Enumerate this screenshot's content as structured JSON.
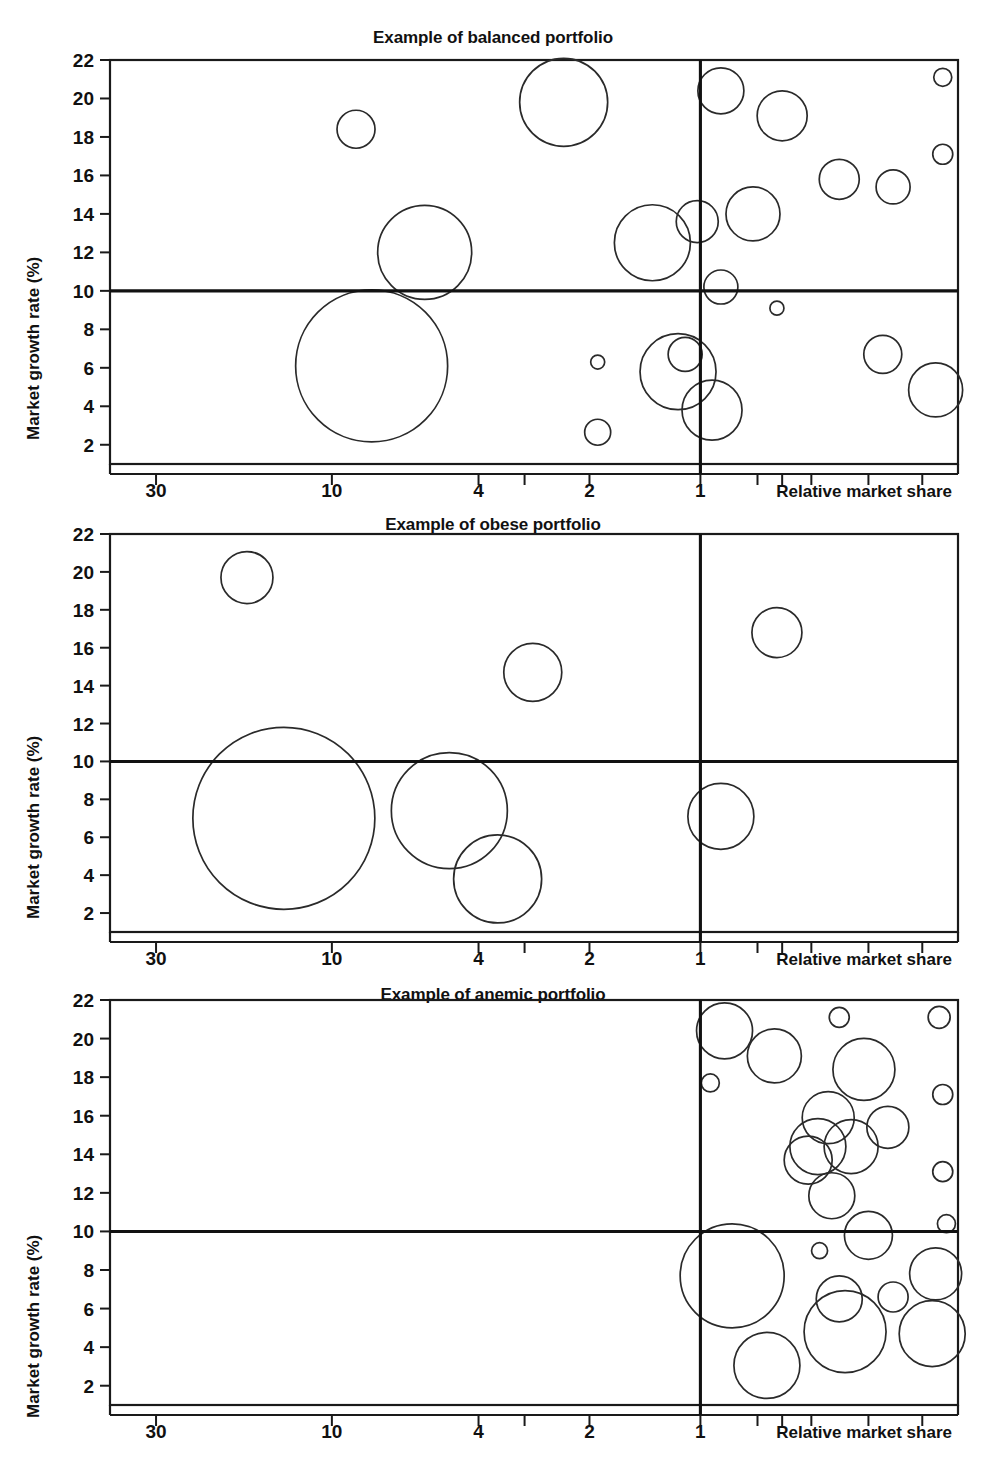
{
  "figure": {
    "background": "#ffffff",
    "line_color": "#1a1a1a",
    "bubble_stroke": "#2a2a2a"
  },
  "panels": [
    {
      "id": "balanced",
      "title": "Example of balanced portfolio"
    },
    {
      "id": "obese",
      "title": "Example of obese portfolio"
    },
    {
      "id": "anemic",
      "title": "Example of anemic portfolio"
    }
  ],
  "axes": {
    "y_axis_label": "Market growth rate (%)",
    "x_axis_label": "Relative market share",
    "y_ticks": [
      2,
      4,
      6,
      8,
      10,
      12,
      14,
      16,
      18,
      20,
      22
    ],
    "y_tick_labels": [
      "2",
      "4",
      "6",
      "8",
      "10",
      "12",
      "14",
      "16",
      "18",
      "20",
      "22"
    ],
    "x_tick_labels": [
      "30",
      "10",
      "4",
      "2",
      "1"
    ],
    "x_labeled_values": [
      30,
      10,
      4,
      2,
      1
    ],
    "x_minor_values": [
      3,
      0.7,
      0.6,
      0.5,
      0.35,
      0.25
    ],
    "x_scale": "log-reversed",
    "xlim": [
      40,
      0.2
    ],
    "ylim": [
      1,
      22
    ],
    "quadrant_split_y": 10,
    "quadrant_split_x": 1,
    "grid": false,
    "legend": "none"
  },
  "chart_data": {
    "type": "scatter",
    "xlabel": "Relative market share",
    "ylabel": "Market growth rate (%)",
    "xlim": [
      40,
      0.2
    ],
    "ylim": [
      1,
      22
    ],
    "x_scale": "log (descending)",
    "grid": false,
    "legend_position": "none",
    "quadrant_lines": {
      "horizontal_y": 10,
      "vertical_x": 1
    },
    "series": [
      {
        "name": "Example of balanced portfolio",
        "points": [
          {
            "x": 8.6,
            "y": 18.4,
            "size": 19
          },
          {
            "x": 2.35,
            "y": 19.8,
            "size": 44
          },
          {
            "x": 0.88,
            "y": 20.4,
            "size": 23
          },
          {
            "x": 0.6,
            "y": 19.1,
            "size": 25
          },
          {
            "x": 0.22,
            "y": 21.1,
            "size": 9
          },
          {
            "x": 0.22,
            "y": 17.1,
            "size": 10
          },
          {
            "x": 0.42,
            "y": 15.8,
            "size": 20
          },
          {
            "x": 0.3,
            "y": 15.4,
            "size": 17
          },
          {
            "x": 0.72,
            "y": 14.0,
            "size": 27
          },
          {
            "x": 1.35,
            "y": 12.5,
            "size": 38
          },
          {
            "x": 1.02,
            "y": 13.6,
            "size": 21
          },
          {
            "x": 0.88,
            "y": 10.2,
            "size": 17
          },
          {
            "x": 5.6,
            "y": 12.0,
            "size": 47
          },
          {
            "x": 7.8,
            "y": 6.1,
            "size": 76
          },
          {
            "x": 0.62,
            "y": 9.1,
            "size": 7
          },
          {
            "x": 1.9,
            "y": 6.3,
            "size": 7
          },
          {
            "x": 1.9,
            "y": 2.65,
            "size": 13
          },
          {
            "x": 1.15,
            "y": 5.8,
            "size": 38
          },
          {
            "x": 1.1,
            "y": 6.7,
            "size": 17
          },
          {
            "x": 0.93,
            "y": 3.8,
            "size": 30
          },
          {
            "x": 0.32,
            "y": 6.7,
            "size": 19
          },
          {
            "x": 0.23,
            "y": 4.85,
            "size": 27
          }
        ]
      },
      {
        "name": "Example of obese portfolio",
        "points": [
          {
            "x": 17.0,
            "y": 19.7,
            "size": 26
          },
          {
            "x": 2.85,
            "y": 14.7,
            "size": 29
          },
          {
            "x": 0.62,
            "y": 16.8,
            "size": 25
          },
          {
            "x": 13.5,
            "y": 7.0,
            "size": 91
          },
          {
            "x": 4.8,
            "y": 7.4,
            "size": 58
          },
          {
            "x": 3.55,
            "y": 3.8,
            "size": 44
          },
          {
            "x": 0.88,
            "y": 7.1,
            "size": 33
          }
        ]
      },
      {
        "name": "Example of anemic portfolio",
        "points": [
          {
            "x": 0.86,
            "y": 20.4,
            "size": 28
          },
          {
            "x": 0.94,
            "y": 17.7,
            "size": 9
          },
          {
            "x": 0.63,
            "y": 19.1,
            "size": 27
          },
          {
            "x": 0.42,
            "y": 21.1,
            "size": 10
          },
          {
            "x": 0.225,
            "y": 21.1,
            "size": 11
          },
          {
            "x": 0.36,
            "y": 18.4,
            "size": 31
          },
          {
            "x": 0.22,
            "y": 17.1,
            "size": 10
          },
          {
            "x": 0.51,
            "y": 13.7,
            "size": 24
          },
          {
            "x": 0.45,
            "y": 15.9,
            "size": 26
          },
          {
            "x": 0.48,
            "y": 14.4,
            "size": 28
          },
          {
            "x": 0.39,
            "y": 14.4,
            "size": 27
          },
          {
            "x": 0.31,
            "y": 15.4,
            "size": 21
          },
          {
            "x": 0.22,
            "y": 13.1,
            "size": 10
          },
          {
            "x": 0.44,
            "y": 11.85,
            "size": 23
          },
          {
            "x": 0.35,
            "y": 9.8,
            "size": 24
          },
          {
            "x": 0.215,
            "y": 10.4,
            "size": 9
          },
          {
            "x": 0.475,
            "y": 9.0,
            "size": 8
          },
          {
            "x": 0.82,
            "y": 7.7,
            "size": 52
          },
          {
            "x": 0.42,
            "y": 6.5,
            "size": 23
          },
          {
            "x": 0.405,
            "y": 4.8,
            "size": 41
          },
          {
            "x": 0.3,
            "y": 6.6,
            "size": 15
          },
          {
            "x": 0.23,
            "y": 7.8,
            "size": 26
          },
          {
            "x": 0.235,
            "y": 4.7,
            "size": 33
          },
          {
            "x": 0.66,
            "y": 3.05,
            "size": 33
          }
        ]
      }
    ]
  }
}
